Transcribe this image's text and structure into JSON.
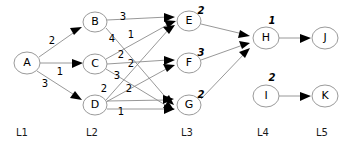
{
  "diagram": {
    "background_color": "#ffffff",
    "node_stroke_color": "#9a9a9a",
    "edge_color": "#8c8c8c",
    "arrow_color": "#000000",
    "text_color": "#000000"
  },
  "layers": [
    {
      "label": "L1",
      "x": 27
    },
    {
      "label": "L2",
      "x": 95
    },
    {
      "label": "L3",
      "x": 189
    },
    {
      "label": "L4",
      "x": 266
    },
    {
      "label": "L5",
      "x": 325
    }
  ],
  "layer_label_y": 133,
  "nodes": [
    {
      "id": "A",
      "label": "A",
      "x": 27,
      "y": 63,
      "rx": 13,
      "ry": 11,
      "layer": "L1",
      "value": ""
    },
    {
      "id": "B",
      "label": "B",
      "x": 95,
      "y": 22,
      "rx": 12,
      "ry": 10,
      "layer": "L2",
      "value": ""
    },
    {
      "id": "C",
      "label": "C",
      "x": 95,
      "y": 64,
      "rx": 12,
      "ry": 10,
      "layer": "L2",
      "value": ""
    },
    {
      "id": "D",
      "label": "D",
      "x": 95,
      "y": 105,
      "rx": 12,
      "ry": 10,
      "layer": "L2",
      "value": ""
    },
    {
      "id": "E",
      "label": "E",
      "x": 189,
      "y": 21,
      "rx": 12,
      "ry": 10,
      "layer": "L3",
      "value": "2"
    },
    {
      "id": "F",
      "label": "F",
      "x": 189,
      "y": 63,
      "rx": 12,
      "ry": 10,
      "layer": "L3",
      "value": "3"
    },
    {
      "id": "G",
      "label": "G",
      "x": 189,
      "y": 105,
      "rx": 12,
      "ry": 10,
      "layer": "L3",
      "value": "2"
    },
    {
      "id": "H",
      "label": "H",
      "x": 266,
      "y": 38,
      "rx": 13,
      "ry": 11,
      "layer": "L4",
      "value": "1"
    },
    {
      "id": "I",
      "label": "I",
      "x": 266,
      "y": 96,
      "rx": 13,
      "ry": 11,
      "layer": "L4",
      "value": "2"
    },
    {
      "id": "J",
      "label": "J",
      "x": 325,
      "y": 38,
      "rx": 13,
      "ry": 11,
      "layer": "L5",
      "value": ""
    },
    {
      "id": "K",
      "label": "K",
      "x": 325,
      "y": 96,
      "rx": 13,
      "ry": 11,
      "layer": "L5",
      "value": ""
    }
  ],
  "node_value_offsets": {
    "E": {
      "dx": 12,
      "dy": -10
    },
    "F": {
      "dx": 12,
      "dy": -10
    },
    "G": {
      "dx": 12,
      "dy": -10
    },
    "H": {
      "dx": 6,
      "dy": -17
    },
    "I": {
      "dx": 6,
      "dy": -18
    }
  },
  "edges": [
    {
      "from": "A",
      "to": "B",
      "weight": "2",
      "label_x": 52,
      "label_y": 41
    },
    {
      "from": "A",
      "to": "C",
      "weight": "1",
      "label_x": 60,
      "label_y": 72
    },
    {
      "from": "A",
      "to": "D",
      "weight": "3",
      "label_x": 45,
      "label_y": 84
    },
    {
      "from": "B",
      "to": "E",
      "weight": "3",
      "label_x": 123,
      "label_y": 17
    },
    {
      "from": "B",
      "to": "G",
      "weight": "4",
      "label_x": 112,
      "label_y": 39
    },
    {
      "from": "C",
      "to": "E",
      "weight": "1",
      "label_x": 131,
      "label_y": 35
    },
    {
      "from": "C",
      "to": "F",
      "weight": "2",
      "label_x": 121,
      "label_y": 55
    },
    {
      "from": "C",
      "to": "G",
      "weight": "2",
      "label_x": 131,
      "label_y": 64
    },
    {
      "from": "D",
      "to": "E",
      "weight": "3",
      "label_x": 117,
      "label_y": 76
    },
    {
      "from": "D",
      "to": "F",
      "weight": "2",
      "label_x": 104,
      "label_y": 89
    },
    {
      "from": "D",
      "to": "G",
      "weight": "2",
      "label_x": 129,
      "label_y": 89
    },
    {
      "from": "D",
      "to": "G2",
      "weight": "1",
      "label_x": 121,
      "label_y": 112
    },
    {
      "from": "E",
      "to": "H",
      "weight": "",
      "label_x": 0,
      "label_y": 0
    },
    {
      "from": "F",
      "to": "H",
      "weight": "",
      "label_x": 0,
      "label_y": 0
    },
    {
      "from": "G",
      "to": "H",
      "weight": "",
      "label_x": 0,
      "label_y": 0
    },
    {
      "from": "H",
      "to": "J",
      "weight": "",
      "label_x": 0,
      "label_y": 0
    },
    {
      "from": "I",
      "to": "K",
      "weight": "",
      "label_x": 0,
      "label_y": 0
    }
  ]
}
